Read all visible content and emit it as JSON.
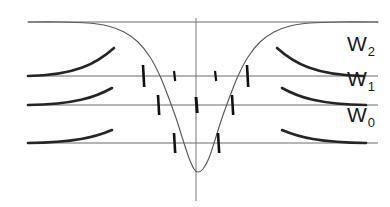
{
  "figure": {
    "title": "",
    "background_color": "#ffffff",
    "ink_color": "#1a1a1a",
    "axis_color": "#555555",
    "curve_color": "#4a4a4a"
  },
  "labels": [
    {
      "name": "level-label-w2",
      "base": "W",
      "subscript": "2",
      "x": 347,
      "y": 33
    },
    {
      "name": "level-label-w1",
      "base": "W",
      "subscript": "1",
      "x": 347,
      "y": 68
    },
    {
      "name": "level-label-w0",
      "base": "W",
      "subscript": "0",
      "x": 347,
      "y": 104
    }
  ],
  "chart_data": {
    "type": "line",
    "title": "",
    "subtitle": "",
    "xlabel": "",
    "ylabel": "",
    "grid": false,
    "legend_position": "right",
    "axes": {
      "vertical_axis": {
        "x": 196,
        "y_top": 18,
        "y_bottom": 201
      },
      "xlim": [
        28,
        378
      ],
      "ylim": [
        201,
        18
      ]
    },
    "potential_curve": {
      "name": "potential-well",
      "points": [
        [
          28,
          22
        ],
        [
          60,
          22
        ],
        [
          88,
          23
        ],
        [
          108,
          26
        ],
        [
          124,
          32
        ],
        [
          138,
          42
        ],
        [
          150,
          57
        ],
        [
          160,
          76
        ],
        [
          168,
          96
        ],
        [
          176,
          118
        ],
        [
          183,
          140
        ],
        [
          189,
          158
        ],
        [
          194,
          169
        ],
        [
          198,
          172
        ],
        [
          203,
          169
        ],
        [
          209,
          158
        ],
        [
          215,
          140
        ],
        [
          222,
          118
        ],
        [
          230,
          96
        ],
        [
          238,
          76
        ],
        [
          248,
          57
        ],
        [
          260,
          42
        ],
        [
          274,
          32
        ],
        [
          290,
          26
        ],
        [
          310,
          23
        ],
        [
          340,
          22
        ],
        [
          378,
          22
        ]
      ]
    },
    "levels": [
      {
        "name": "W2",
        "label": "W2",
        "y": 76,
        "x_start": 28,
        "x_end": 378,
        "nodes": 2,
        "ticks": [
          {
            "x": 143,
            "half_length": 11,
            "weight": 2.6
          },
          {
            "x": 174,
            "half_length": 5,
            "weight": 2.2
          },
          {
            "x": 215,
            "half_length": 5,
            "weight": 2.2
          },
          {
            "x": 247,
            "half_length": 11,
            "weight": 2.6
          }
        ],
        "left_wing": {
          "x_start": 28,
          "x_end": 114,
          "y_start": 76,
          "y_peak": 48
        },
        "right_wing": {
          "x_start": 277,
          "x_end": 363,
          "y_start": 48,
          "y_end": 76
        }
      },
      {
        "name": "W1",
        "label": "W1",
        "y": 105,
        "x_start": 28,
        "x_end": 378,
        "nodes": 1,
        "ticks": [
          {
            "x": 158,
            "half_length": 10,
            "weight": 2.6
          },
          {
            "x": 196,
            "half_length": 8,
            "weight": 3.0
          },
          {
            "x": 232,
            "half_length": 10,
            "weight": 2.6
          }
        ],
        "left_wing": {
          "x_start": 28,
          "x_end": 112,
          "y_start": 105,
          "y_peak": 88
        },
        "right_wing": {
          "x_start": 282,
          "x_end": 366,
          "y_start": 88,
          "y_end": 105
        }
      },
      {
        "name": "W0",
        "label": "W0",
        "y": 143,
        "x_start": 28,
        "x_end": 378,
        "nodes": 0,
        "ticks": [
          {
            "x": 174,
            "half_length": 10,
            "weight": 2.6
          },
          {
            "x": 218,
            "half_length": 10,
            "weight": 2.6
          }
        ],
        "left_wing": {
          "x_start": 28,
          "x_end": 112,
          "y_start": 143,
          "y_peak": 130
        },
        "right_wing": {
          "x_start": 282,
          "x_end": 366,
          "y_start": 130,
          "y_end": 143
        }
      }
    ],
    "top_asymptote": {
      "y": 22,
      "x_start": 28,
      "x_end": 378
    }
  }
}
